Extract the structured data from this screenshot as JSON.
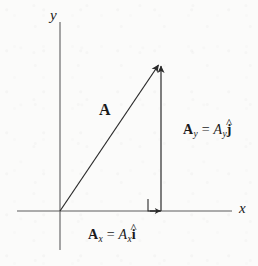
{
  "figure": {
    "kind": "vector-component-diagram",
    "background_color": "#fbfbfa",
    "ink_color": "#2b2b2b"
  },
  "axes": {
    "y_label": "y",
    "x_label": "x",
    "origin": {
      "x": 60,
      "y": 211
    },
    "x_axis": {
      "x1": 17,
      "x2": 232,
      "y": 211
    },
    "y_axis": {
      "x": 60,
      "y1": 22,
      "y2": 250
    }
  },
  "vectors": {
    "resultant": {
      "label": "A",
      "start": {
        "x": 60,
        "y": 211
      },
      "end": {
        "x": 161,
        "y": 62
      },
      "label_pos": {
        "x": 100,
        "y": 103
      }
    },
    "y_component": {
      "start": {
        "x": 161,
        "y": 211
      },
      "end": {
        "x": 161,
        "y": 62
      },
      "equation": {
        "bold_symbol": "A",
        "bold_subscript": "y",
        "equals": "=",
        "scalar": "A",
        "scalar_subscript": "y",
        "unit_vector": "j",
        "hat": "^"
      },
      "equation_plain": "A_y = A_y ĵ"
    },
    "x_component": {
      "start": {
        "x": 60,
        "y": 211
      },
      "end": {
        "x": 161,
        "y": 211
      },
      "equation": {
        "bold_symbol": "A",
        "bold_subscript": "x",
        "equals": "=",
        "scalar": "A",
        "scalar_subscript": "x",
        "unit_vector": "i",
        "hat": "^"
      },
      "equation_plain": "A_x = A_x î"
    }
  },
  "markers": {
    "right_angle": {
      "x": 148,
      "y": 199,
      "size": 12
    }
  }
}
